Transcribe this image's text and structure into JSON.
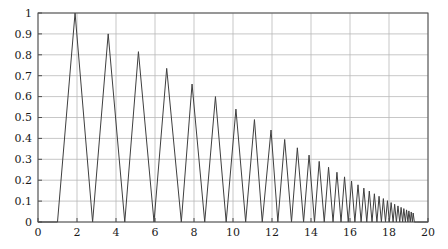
{
  "chart_data": {
    "type": "line",
    "title": "",
    "xlabel": "",
    "ylabel": "",
    "xlim": [
      0,
      20
    ],
    "ylim": [
      0,
      1
    ],
    "grid": true,
    "legend": null,
    "xticks": [
      0,
      2,
      4,
      6,
      8,
      10,
      12,
      14,
      16,
      18,
      20
    ],
    "xtick_labels": [
      "0",
      "2",
      "4",
      "6",
      "8",
      "10",
      "12",
      "14",
      "16",
      "18",
      "20"
    ],
    "yticks": [
      0,
      0.1,
      0.2,
      0.3,
      0.4,
      0.5,
      0.6,
      0.7,
      0.8,
      0.9,
      1
    ],
    "ytick_labels": [
      "0",
      "0.1",
      "0.2",
      "0.3",
      "0.4",
      "0.5",
      "0.6",
      "0.7",
      "0.8",
      "0.9",
      "1"
    ],
    "series": [
      {
        "name": "rectified decaying chirp",
        "color": "#3f3f3f",
        "line_width": 1,
        "peaks_x": [
          1.9,
          3.6,
          5.15,
          6.6,
          7.9,
          9.1,
          10.15,
          11.1,
          11.95,
          12.65,
          13.3,
          13.9,
          14.42,
          14.9,
          15.33,
          15.72,
          16.08,
          16.41,
          16.71,
          16.99,
          17.25,
          17.49,
          17.71,
          17.92,
          18.11,
          18.29,
          18.46,
          18.62,
          18.76,
          18.9,
          19.02,
          19.14,
          19.24
        ],
        "peaks_y": [
          1.0,
          0.9,
          0.815,
          0.735,
          0.66,
          0.6,
          0.54,
          0.49,
          0.44,
          0.395,
          0.355,
          0.32,
          0.29,
          0.262,
          0.238,
          0.216,
          0.196,
          0.178,
          0.162,
          0.148,
          0.135,
          0.123,
          0.112,
          0.102,
          0.093,
          0.085,
          0.077,
          0.07,
          0.064,
          0.058,
          0.053,
          0.048,
          0.043
        ],
        "zeros_x": [
          1.0,
          2.8,
          4.45,
          5.95,
          7.35,
          8.55,
          9.65,
          10.65,
          11.5,
          12.3,
          13.0,
          13.62,
          14.18,
          14.68,
          15.13,
          15.54,
          15.91,
          16.25,
          16.57,
          16.86,
          17.13,
          17.38,
          17.61,
          17.82,
          18.02,
          18.21,
          18.38,
          18.55,
          18.7,
          18.84,
          18.97,
          19.09,
          19.2,
          19.3,
          19.4,
          19.48
        ],
        "start_point": [
          0.0,
          0.0
        ],
        "end_point": [
          20.0,
          0.0
        ]
      }
    ],
    "axes_style": {
      "grid_color": "#b9b9b9",
      "axis_color": "#4d4d4d",
      "background": "#ffffff",
      "tick_color": "#4d4d4d"
    }
  },
  "figure": {
    "plot_left": 38,
    "plot_top": 13,
    "plot_right": 428,
    "plot_bottom": 222
  }
}
